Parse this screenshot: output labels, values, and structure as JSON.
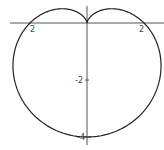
{
  "chart_data": {
    "type": "line",
    "title": "",
    "subtitle": "",
    "equation": "r = 2 - 2 sin(θ)",
    "xlabel": "",
    "ylabel": "",
    "xlim": [
      -3,
      2.7
    ],
    "ylim": [
      -4.5,
      0.8
    ],
    "grid": false,
    "legend": null,
    "x_tick_labels": [
      {
        "value": -2,
        "label": "2"
      },
      {
        "value": 2,
        "label": "2"
      }
    ],
    "y_tick_labels": [
      {
        "value": -2,
        "label": "-2"
      },
      {
        "value": -4,
        "label": "-4"
      }
    ],
    "key_points": [
      {
        "x": 0,
        "y": 0,
        "note": "cusp"
      },
      {
        "x": -2,
        "y": 0
      },
      {
        "x": 2,
        "y": 0
      },
      {
        "x": 0,
        "y": -4
      }
    ],
    "series": [
      {
        "name": "cardioid",
        "color": "#222222"
      }
    ]
  },
  "layout": {
    "origin_px": [
      87,
      23
    ],
    "unit_px": 28.5
  },
  "labels": {
    "x_neg2": "2",
    "x_pos2": "2",
    "y_neg2": "-2",
    "y_neg4": "-4"
  }
}
